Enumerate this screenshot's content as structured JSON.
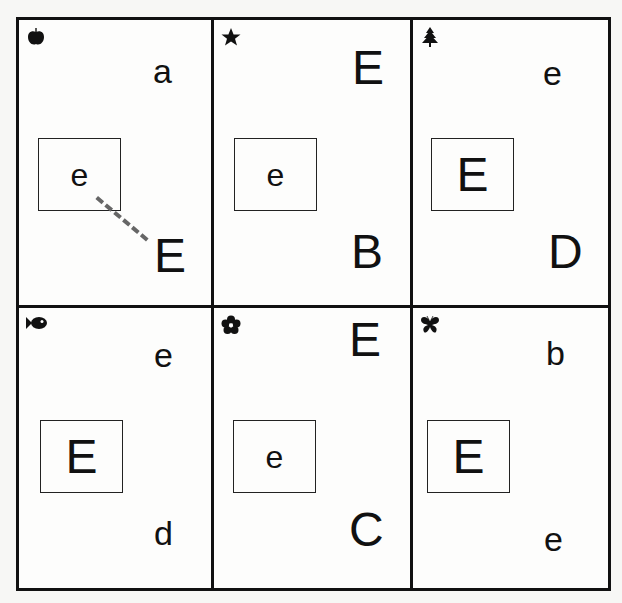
{
  "worksheet": {
    "title": "Letter Ee matching grid",
    "line_color": "#111111",
    "connector_color": "#666666",
    "cells": [
      {
        "id": "apple",
        "icon": "apple-icon",
        "target": "e",
        "letters": [
          "a",
          "E"
        ],
        "connector": {
          "from": "target e",
          "to": "E"
        }
      },
      {
        "id": "star",
        "icon": "star-icon",
        "target": "e",
        "letters": [
          "E",
          "B"
        ]
      },
      {
        "id": "tree",
        "icon": "tree-icon",
        "target": "E",
        "letters": [
          "e",
          "D"
        ]
      },
      {
        "id": "fish",
        "icon": "fish-icon",
        "target": "E",
        "letters": [
          "e",
          "d"
        ]
      },
      {
        "id": "flower",
        "icon": "flower-icon",
        "target": "e",
        "letters": [
          "E",
          "C"
        ]
      },
      {
        "id": "butterfly",
        "icon": "butterfly-icon",
        "target": "E",
        "letters": [
          "b",
          "e"
        ]
      }
    ]
  }
}
